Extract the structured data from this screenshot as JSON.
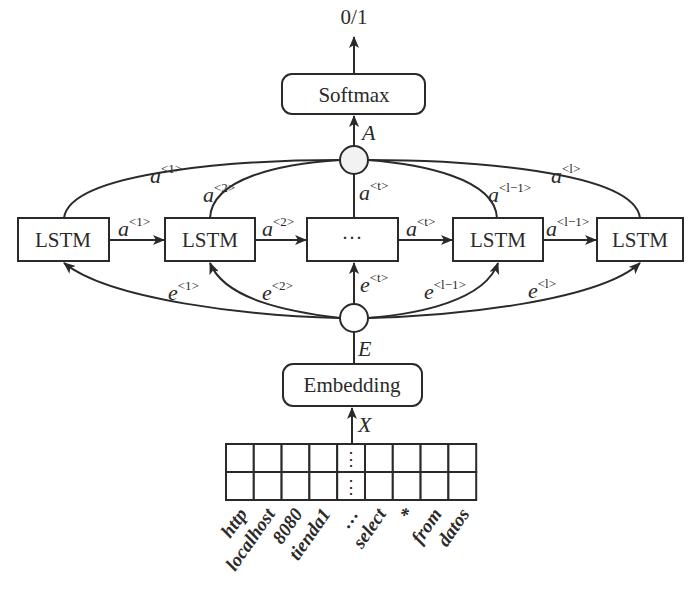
{
  "figure": {
    "output_label": "0/1",
    "softmax_label": "Softmax",
    "attention_symbol": "A",
    "embedding_label": "Embedding",
    "embedding_symbol": "E",
    "input_symbol": "X",
    "ellipsis": "···",
    "vertical_ellipsis": "⋮",
    "lstm_cells": [
      {
        "label": "LSTM"
      },
      {
        "label": "LSTM"
      },
      {
        "label": "···"
      },
      {
        "label": "LSTM"
      },
      {
        "label": "LSTM"
      }
    ],
    "hidden_arrows": [
      {
        "base": "a",
        "sup": "<1>"
      },
      {
        "base": "a",
        "sup": "<2>"
      },
      {
        "base": "a",
        "sup": "<t>"
      },
      {
        "base": "a",
        "sup": "<l−1>"
      }
    ],
    "attention_edges": [
      {
        "base": "a",
        "sup": "<1>"
      },
      {
        "base": "a",
        "sup": "<2>"
      },
      {
        "base": "a",
        "sup": "<t>"
      },
      {
        "base": "a",
        "sup": "<l−1>"
      },
      {
        "base": "a",
        "sup": "<l>"
      }
    ],
    "embedding_edges": [
      {
        "base": "e",
        "sup": "<1>"
      },
      {
        "base": "e",
        "sup": "<2>"
      },
      {
        "base": "e",
        "sup": "<t>"
      },
      {
        "base": "e",
        "sup": "<l−1>"
      },
      {
        "base": "e",
        "sup": "<l>"
      }
    ],
    "tokens": [
      "http",
      "localhost",
      "8080",
      "tienda1",
      "…",
      "select",
      "*",
      "from",
      "datos"
    ]
  }
}
